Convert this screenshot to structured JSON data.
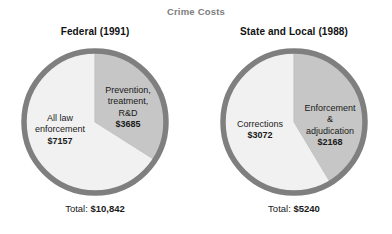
{
  "chart_data": {
    "type": "pie",
    "title": "Crime Costs",
    "title_color": "#7d7d7d",
    "colors": {
      "light_slice": "#f1f1f1",
      "dark_slice": "#c6c6c6",
      "ring": "#7f7f7f",
      "background": "#ffffff"
    },
    "charts": [
      {
        "title": "Federal (1991)",
        "categories": [
          "All law enforcement",
          "Prevention, treatment, R&D"
        ],
        "values": [
          7157,
          3685
        ],
        "total": 10842,
        "total_label": "Total:",
        "total_value": "$10,842",
        "slices": [
          {
            "label": "All law\nenforcement",
            "value_label": "$7157",
            "value": 7157,
            "percent": 66.0,
            "fill": "#f1f1f1",
            "start_angle": 122.4,
            "end_angle": 360
          },
          {
            "label": "Prevention,\ntreatment,\nR&D",
            "value_label": "$3685",
            "value": 3685,
            "percent": 34.0,
            "fill": "#c6c6c6",
            "start_angle": 0,
            "end_angle": 122.4
          }
        ]
      },
      {
        "title": "State and Local (1988)",
        "categories": [
          "Corrections",
          "Enforcement & adjudication"
        ],
        "values": [
          3072,
          2168
        ],
        "total": 5240,
        "total_label": "Total:",
        "total_value": "$5240",
        "slices": [
          {
            "label": "Corrections",
            "value_label": "$3072",
            "value": 3072,
            "percent": 58.6,
            "fill": "#f1f1f1",
            "start_angle": 149.0,
            "end_angle": 360
          },
          {
            "label": "Enforcement\n&\nadjudication",
            "value_label": "$2168",
            "value": 2168,
            "percent": 41.4,
            "fill": "#c6c6c6",
            "start_angle": 0,
            "end_angle": 149.0
          }
        ]
      }
    ]
  }
}
